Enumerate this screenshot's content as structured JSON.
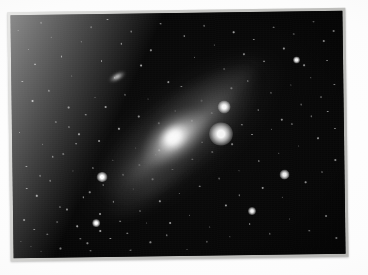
{
  "scene": {
    "kind": "photograph",
    "subject": "spiral galaxy",
    "caption_visible": "",
    "background_color": "#ffffff",
    "frame_color": "#c9c9c6",
    "sky_color": "#050505"
  },
  "frame": {
    "label": "photographic print",
    "left": 9,
    "top": 10,
    "width": 338,
    "height": 249,
    "rotation_deg": -0.75,
    "border_px": 3
  },
  "photo": {
    "label": "night sky exposure",
    "width": 332,
    "height": 243
  },
  "objects": {
    "galaxy": {
      "label": "spiral galaxy",
      "position_pct": {
        "x": 49,
        "y": 49
      },
      "disk_angle_deg": -38,
      "disk_length_px": 310,
      "disk_width_px": 128,
      "nucleus_color": "#ffffff",
      "disk_color": "#c8c8c8"
    },
    "companion_galaxy": {
      "label": "companion elliptical galaxy",
      "position_pct": {
        "x": 32,
        "y": 26
      },
      "angle_deg": -28,
      "width_px": 22,
      "height_px": 10,
      "color": "#ffffff"
    },
    "bright_stars": [
      {
        "x_pct": 63,
        "y_pct": 50,
        "size_px": 9,
        "color": "#ffffff"
      },
      {
        "x_pct": 64,
        "y_pct": 39,
        "size_px": 5,
        "color": "#ffffff"
      },
      {
        "x_pct": 27,
        "y_pct": 67,
        "size_px": 4,
        "color": "#ffffff"
      },
      {
        "x_pct": 82,
        "y_pct": 67,
        "size_px": 4,
        "color": "#ffffff"
      },
      {
        "x_pct": 25,
        "y_pct": 86,
        "size_px": 3,
        "color": "#ffffff"
      },
      {
        "x_pct": 86,
        "y_pct": 20,
        "size_px": 3,
        "color": "#ffffff"
      },
      {
        "x_pct": 72,
        "y_pct": 82,
        "size_px": 3,
        "color": "#ffffff"
      }
    ],
    "star_counts": {
      "bright": 7,
      "field_stars": 260
    }
  },
  "chart_data": {
    "type": "scatter",
    "title": "",
    "xlabel": "",
    "ylabel": "",
    "note": "star field positions given as percentage of photo area, with relative brightness 0-1",
    "stars": [
      [
        2,
        6,
        0.35
      ],
      [
        5,
        14,
        0.25
      ],
      [
        9,
        3,
        0.3
      ],
      [
        12,
        9,
        0.22
      ],
      [
        7,
        20,
        0.45
      ],
      [
        15,
        17,
        0.28
      ],
      [
        3,
        27,
        0.3
      ],
      [
        11,
        31,
        0.38
      ],
      [
        18,
        25,
        0.2
      ],
      [
        21,
        11,
        0.33
      ],
      [
        24,
        5,
        0.26
      ],
      [
        17,
        38,
        0.24
      ],
      [
        6,
        35,
        0.42
      ],
      [
        13,
        44,
        0.27
      ],
      [
        2,
        48,
        0.34
      ],
      [
        9,
        53,
        0.22
      ],
      [
        20,
        49,
        0.3
      ],
      [
        15,
        57,
        0.38
      ],
      [
        4,
        62,
        0.26
      ],
      [
        11,
        68,
        0.31
      ],
      [
        18,
        64,
        0.21
      ],
      [
        7,
        74,
        0.4
      ],
      [
        14,
        79,
        0.25
      ],
      [
        3,
        84,
        0.33
      ],
      [
        10,
        90,
        0.28
      ],
      [
        19,
        87,
        0.36
      ],
      [
        23,
        73,
        0.23
      ],
      [
        26,
        82,
        0.3
      ],
      [
        22,
        94,
        0.27
      ],
      [
        5,
        95,
        0.24
      ],
      [
        29,
        2,
        0.29
      ],
      [
        33,
        12,
        0.35
      ],
      [
        27,
        19,
        0.23
      ],
      [
        36,
        7,
        0.31
      ],
      [
        31,
        26,
        0.26
      ],
      [
        39,
        21,
        0.38
      ],
      [
        34,
        33,
        0.22
      ],
      [
        28,
        38,
        0.3
      ],
      [
        42,
        15,
        0.25
      ],
      [
        45,
        4,
        0.33
      ],
      [
        38,
        42,
        0.28
      ],
      [
        32,
        47,
        0.36
      ],
      [
        26,
        52,
        0.24
      ],
      [
        41,
        35,
        0.21
      ],
      [
        47,
        28,
        0.3
      ],
      [
        44,
        45,
        0.27
      ],
      [
        37,
        55,
        0.34
      ],
      [
        30,
        60,
        0.25
      ],
      [
        24,
        63,
        0.32
      ],
      [
        43,
        58,
        0.23
      ],
      [
        49,
        40,
        0.29
      ],
      [
        52,
        9,
        0.37
      ],
      [
        55,
        18,
        0.26
      ],
      [
        58,
        5,
        0.3
      ],
      [
        51,
        30,
        0.24
      ],
      [
        61,
        13,
        0.33
      ],
      [
        64,
        23,
        0.28
      ],
      [
        57,
        36,
        0.21
      ],
      [
        67,
        8,
        0.35
      ],
      [
        70,
        17,
        0.27
      ],
      [
        54,
        44,
        0.32
      ],
      [
        60,
        41,
        0.25
      ],
      [
        66,
        31,
        0.3
      ],
      [
        73,
        11,
        0.23
      ],
      [
        76,
        20,
        0.36
      ],
      [
        79,
        6,
        0.29
      ],
      [
        71,
        28,
        0.26
      ],
      [
        82,
        15,
        0.33
      ],
      [
        85,
        9,
        0.24
      ],
      [
        88,
        22,
        0.31
      ],
      [
        91,
        4,
        0.27
      ],
      [
        94,
        12,
        0.35
      ],
      [
        78,
        33,
        0.22
      ],
      [
        84,
        30,
        0.28
      ],
      [
        90,
        27,
        0.34
      ],
      [
        95,
        20,
        0.26
      ],
      [
        97,
        8,
        0.3
      ],
      [
        74,
        40,
        0.25
      ],
      [
        81,
        44,
        0.32
      ],
      [
        87,
        38,
        0.23
      ],
      [
        93,
        35,
        0.29
      ],
      [
        97,
        30,
        0.27
      ],
      [
        69,
        46,
        0.34
      ],
      [
        63,
        50,
        0.22
      ],
      [
        57,
        53,
        0.3
      ],
      [
        50,
        51,
        0.26
      ],
      [
        44,
        56,
        0.33
      ],
      [
        38,
        62,
        0.24
      ],
      [
        33,
        66,
        0.31
      ],
      [
        27,
        70,
        0.28
      ],
      [
        21,
        75,
        0.35
      ],
      [
        16,
        80,
        0.23
      ],
      [
        30,
        77,
        0.29
      ],
      [
        36,
        72,
        0.26
      ],
      [
        42,
        68,
        0.32
      ],
      [
        48,
        64,
        0.21
      ],
      [
        54,
        60,
        0.28
      ],
      [
        60,
        57,
        0.34
      ],
      [
        66,
        54,
        0.25
      ],
      [
        72,
        50,
        0.31
      ],
      [
        78,
        48,
        0.27
      ],
      [
        84,
        46,
        0.33
      ],
      [
        90,
        43,
        0.24
      ],
      [
        95,
        41,
        0.3
      ],
      [
        97,
        48,
        0.26
      ],
      [
        92,
        52,
        0.32
      ],
      [
        86,
        55,
        0.23
      ],
      [
        80,
        58,
        0.29
      ],
      [
        74,
        61,
        0.35
      ],
      [
        68,
        65,
        0.22
      ],
      [
        62,
        68,
        0.28
      ],
      [
        56,
        71,
        0.34
      ],
      [
        50,
        74,
        0.26
      ],
      [
        44,
        77,
        0.31
      ],
      [
        38,
        81,
        0.23
      ],
      [
        32,
        85,
        0.29
      ],
      [
        26,
        89,
        0.35
      ],
      [
        20,
        92,
        0.27
      ],
      [
        14,
        96,
        0.3
      ],
      [
        8,
        97,
        0.24
      ],
      [
        47,
        86,
        0.32
      ],
      [
        53,
        83,
        0.25
      ],
      [
        59,
        88,
        0.31
      ],
      [
        65,
        92,
        0.27
      ],
      [
        71,
        87,
        0.33
      ],
      [
        77,
        91,
        0.22
      ],
      [
        83,
        85,
        0.29
      ],
      [
        89,
        90,
        0.35
      ],
      [
        94,
        84,
        0.26
      ],
      [
        97,
        93,
        0.3
      ],
      [
        41,
        94,
        0.24
      ],
      [
        35,
        97,
        0.32
      ],
      [
        68,
        75,
        0.27
      ],
      [
        75,
        72,
        0.33
      ],
      [
        81,
        76,
        0.25
      ],
      [
        88,
        70,
        0.31
      ],
      [
        93,
        66,
        0.23
      ],
      [
        97,
        61,
        0.29
      ],
      [
        64,
        79,
        0.35
      ],
      [
        58,
        94,
        0.22
      ],
      [
        52,
        97,
        0.28
      ],
      [
        46,
        91,
        0.34
      ],
      [
        17,
        46,
        0.26
      ],
      [
        22,
        41,
        0.32
      ],
      [
        25,
        34,
        0.23
      ],
      [
        19,
        53,
        0.29
      ],
      [
        12,
        58,
        0.35
      ],
      [
        8,
        66,
        0.27
      ],
      [
        4,
        71,
        0.3
      ],
      [
        13,
        85,
        0.24
      ],
      [
        6,
        88,
        0.32
      ],
      [
        2,
        93,
        0.25
      ],
      [
        29,
        92,
        0.31
      ],
      [
        23,
        97,
        0.27
      ],
      [
        34,
        90,
        0.33
      ],
      [
        40,
        86,
        0.22
      ]
    ]
  }
}
